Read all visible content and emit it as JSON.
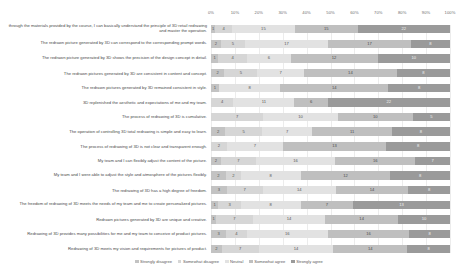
{
  "chart_data": {
    "type": "bar",
    "subtype": "stacked-horizontal-100-percent",
    "title": "",
    "xlabel": "",
    "ylabel": "",
    "xlim": [
      0,
      100
    ],
    "grid": true,
    "legend_position": "bottom",
    "xticks": [
      "0%",
      "10%",
      "20%",
      "30%",
      "40%",
      "50%",
      "60%",
      "70%",
      "80%",
      "90%",
      "100%"
    ],
    "series": [
      {
        "name": "Strongly disagree",
        "color": "#c3c3c3",
        "values": [
          1,
          2,
          1,
          2,
          1,
          0,
          0,
          2,
          0,
          2,
          2,
          3,
          1,
          1,
          3,
          2
        ]
      },
      {
        "name": "Somewhat disagree",
        "color": "#d6d6d6",
        "values": [
          4,
          5,
          4,
          5,
          0,
          4,
          7,
          5,
          2,
          7,
          2,
          7,
          3,
          7,
          4,
          7
        ]
      },
      {
        "name": "Neutral",
        "color": "#e2e2e2",
        "values": [
          15,
          17,
          6,
          7,
          8,
          11,
          10,
          7,
          7,
          16,
          8,
          14,
          8,
          14,
          16,
          14
        ]
      },
      {
        "name": "Somewhat agree",
        "color": "#bfbfbf",
        "values": [
          15,
          17,
          12,
          14,
          14,
          6,
          10,
          11,
          13,
          16,
          12,
          14,
          7,
          14,
          16,
          14
        ]
      },
      {
        "name": "Strongly agree",
        "color": "#9a9a9a",
        "values": [
          22,
          8,
          10,
          8,
          8,
          22,
          5,
          8,
          8,
          7,
          8,
          8,
          13,
          10,
          8,
          8
        ]
      }
    ],
    "categories": [
      "through the materials provided by the course, I can basically understand the principle of 3D retail redrawing and master the operation.",
      "The redrawn picture generated by 3D can correspond to the corresponding prompt words.",
      "The redrawn picture generated by 3D shows the precision of the design concept in detail.",
      "The redrawn pictures generated by 3D are consistent in content and concept.",
      "The redrawn pictures generated by 3D remained consistent in style.",
      "3D replenished the aesthetic and expectations of me and my team.",
      "The process of redrawing of 3D is cumulative.",
      "The operation of controlling 3D total redrawing is simple and easy to learn.",
      "The process of redrawing of 3D is not clear and transparent enough.",
      "My team and I can flexibly adjust the content of the picture.",
      "My team and I were able to adjust the style and atmosphere of the pictures flexibly.",
      "The redrawing of 3D has a high degree of freedom.",
      "The freedom of redrawing of 3D meets the needs of my team and me to create personalized pictures.",
      "Redrawn pictures generated by 3D are unique and creative.",
      "Redrawing of 3D provides many possibilities for me and my team to conceive of product pictures.",
      "Redrawing of 3D meets my vision and requirements for pictures of product."
    ],
    "data_labels": [
      [
        1,
        4,
        15,
        15,
        22
      ],
      [
        2,
        5,
        17,
        17,
        8
      ],
      [
        1,
        4,
        6,
        12,
        10
      ],
      [
        2,
        5,
        7,
        14,
        8
      ],
      [
        1,
        0,
        8,
        14,
        8
      ],
      [
        0,
        4,
        11,
        6,
        22
      ],
      [
        0,
        7,
        10,
        10,
        5
      ],
      [
        2,
        5,
        7,
        11,
        8
      ],
      [
        0,
        2,
        7,
        13,
        8
      ],
      [
        2,
        7,
        16,
        16,
        7
      ],
      [
        2,
        2,
        8,
        12,
        8
      ],
      [
        3,
        7,
        14,
        14,
        8
      ],
      [
        1,
        3,
        8,
        7,
        13
      ],
      [
        1,
        7,
        14,
        14,
        10
      ],
      [
        3,
        4,
        16,
        16,
        8
      ],
      [
        2,
        7,
        14,
        14,
        8
      ]
    ]
  }
}
